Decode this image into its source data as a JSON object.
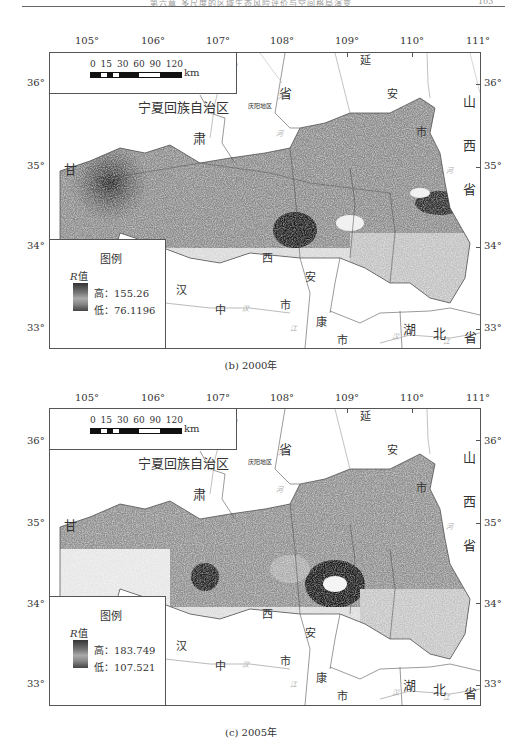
{
  "header": {
    "running_title": "第六章  多尺度的区域生态风险评价与空间格局演变",
    "page_number": "103"
  },
  "panels": [
    {
      "caption": "(b) 2000年",
      "lon_labels": [
        "105°",
        "106°",
        "107°",
        "108°",
        "109°",
        "110°",
        "111°"
      ],
      "lat_labels_left": [
        "36°",
        "35°",
        "34°",
        "33°"
      ],
      "lat_labels_right": [
        "36°",
        "35°",
        "34°",
        "33°"
      ],
      "scale": {
        "ticks": "0 15 30   60   90   120",
        "unit": "km"
      },
      "legend": {
        "title": "图例",
        "field": "R",
        "field_suffix": "值",
        "high_label": "高：155.26",
        "low_label": "低：76.1196"
      },
      "places": {
        "ningxia": "宁夏回族自治区",
        "gan": "甘",
        "su": "肃",
        "sheng1": "省",
        "qingyang": "庆阳地区",
        "yan": "延",
        "an1": "安",
        "shi1": "市",
        "shan": "山",
        "xi1": "西",
        "sheng2": "省",
        "xi2": "西",
        "shi2": "市",
        "zhong": "中",
        "shi3": "市",
        "an2": "安",
        "kang": "康",
        "shi4": "市",
        "hu": "湖",
        "bei": "北",
        "sheng3": "省",
        "han": "汉"
      },
      "rivers": [
        "河",
        "渭",
        "河",
        "河",
        "汉",
        "江",
        "汉",
        "江"
      ]
    },
    {
      "caption": "(c) 2005年",
      "lon_labels": [
        "105°",
        "106°",
        "107°",
        "108°",
        "109°",
        "110°",
        "111°"
      ],
      "lat_labels_left": [
        "36°",
        "35°",
        "34°",
        "33°"
      ],
      "lat_labels_right": [
        "36°",
        "35°",
        "34°",
        "33°"
      ],
      "scale": {
        "ticks": "0 15 30   60   90   120",
        "unit": "km"
      },
      "legend": {
        "title": "图例",
        "field": "R",
        "field_suffix": "值",
        "high_label": "高：183.749",
        "low_label": "低：107.521"
      },
      "places": {
        "ningxia": "宁夏回族自治区",
        "gan": "甘",
        "su": "肃",
        "sheng1": "省",
        "qingyang": "庆阳地区",
        "yan": "延",
        "an1": "安",
        "shi1": "市",
        "shan": "山",
        "xi1": "西",
        "sheng2": "省",
        "xi2": "西",
        "shi2": "市",
        "zhong": "中",
        "shi3": "市",
        "an2": "安",
        "kang": "康",
        "shi4": "市",
        "hu": "湖",
        "bei": "北",
        "sheng3": "省",
        "han": "汉"
      },
      "rivers": [
        "河",
        "渭",
        "河",
        "河",
        "汉",
        "江",
        "汉",
        "江"
      ]
    }
  ]
}
